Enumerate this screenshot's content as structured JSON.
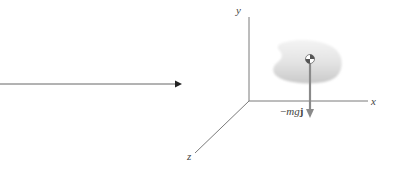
{
  "diagram": {
    "type": "free-body-diagram",
    "pointer_arrow": {
      "from": [
        0,
        84
      ],
      "to": [
        182,
        84
      ],
      "color": "#555555"
    },
    "axes": {
      "origin": [
        249,
        101
      ],
      "x": {
        "label": "x",
        "end": [
          368,
          101
        ]
      },
      "y": {
        "label": "y",
        "end": [
          249,
          17
        ]
      },
      "z": {
        "label": "z",
        "end": [
          195,
          153
        ]
      },
      "color": "#777777"
    },
    "body": {
      "shape": "kidney-blob",
      "fill_top": "#f1f1f1",
      "fill_bottom": "#cfcfcf"
    },
    "center_of_mass": {
      "position": [
        310,
        59
      ],
      "symbol": "center-of-mass-symbol"
    },
    "force": {
      "label_prefix": "−",
      "label_italic": "mg",
      "label_bold": "j",
      "from": [
        310,
        63
      ],
      "to": [
        310,
        117
      ],
      "color": "#888888"
    }
  }
}
